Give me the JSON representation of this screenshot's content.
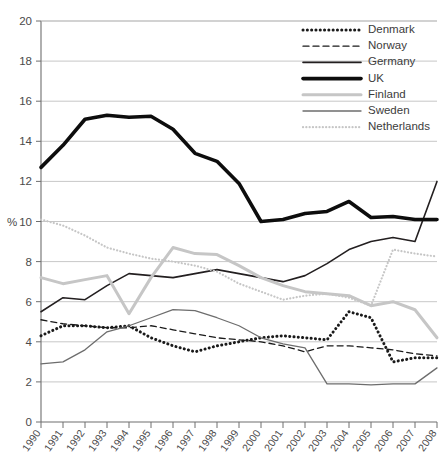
{
  "figure": {
    "truncated_header_text": "",
    "background": "#ffffff"
  },
  "chart_data": {
    "type": "line",
    "title": "",
    "xlabel": "",
    "ylabel": "%",
    "ylim": [
      0,
      20
    ],
    "ytick_step": 2,
    "yticks": [
      "0",
      "2",
      "4",
      "6",
      "8",
      "10",
      "12",
      "14",
      "16",
      "18",
      "20"
    ],
    "grid": true,
    "grid_axis": "y",
    "legend_position": "top-right",
    "x": [
      1990,
      1991,
      1992,
      1993,
      1994,
      1995,
      1996,
      1997,
      1998,
      1999,
      2000,
      2001,
      2002,
      2003,
      2004,
      2005,
      2006,
      2007,
      2008
    ],
    "categories": [
      "1990",
      "1991",
      "1992",
      "1993",
      "1994",
      "1995",
      "1996",
      "1997",
      "1998",
      "1999",
      "2000",
      "2001",
      "2002",
      "2003",
      "2004",
      "2005",
      "2006",
      "2007",
      "2008"
    ],
    "series": [
      {
        "name": "Denmark",
        "style": "dotted-thick",
        "color": "#1a1a1a",
        "width": 3.0,
        "dash": "0.1,4.2",
        "values": [
          4.3,
          4.8,
          4.8,
          4.7,
          4.8,
          4.2,
          3.8,
          3.5,
          3.8,
          4.0,
          4.2,
          4.3,
          4.2,
          4.1,
          5.5,
          5.2,
          3.0,
          3.2,
          3.2
        ]
      },
      {
        "name": "Norway",
        "style": "dashed",
        "color": "#1a1a1a",
        "width": 1.3,
        "dash": "6,4",
        "values": [
          5.1,
          4.9,
          4.8,
          4.7,
          4.7,
          4.8,
          4.6,
          4.4,
          4.2,
          4.1,
          4.0,
          3.8,
          3.5,
          3.8,
          3.8,
          3.7,
          3.6,
          3.4,
          3.3
        ]
      },
      {
        "name": "Germany",
        "style": "solid-thin",
        "color": "#231f20",
        "width": 1.6,
        "dash": "",
        "values": [
          5.5,
          6.2,
          6.1,
          6.8,
          7.4,
          7.3,
          7.2,
          7.4,
          7.6,
          7.4,
          7.2,
          7.0,
          7.3,
          7.9,
          8.6,
          9.0,
          9.2,
          9.0,
          12.0
        ]
      },
      {
        "name": "UK",
        "style": "solid-thick",
        "color": "#0d0d0d",
        "width": 3.6,
        "dash": "",
        "values": [
          12.7,
          13.8,
          15.1,
          15.3,
          15.2,
          15.25,
          14.6,
          13.4,
          13.0,
          11.9,
          10.0,
          10.1,
          10.4,
          10.5,
          11.0,
          10.2,
          10.25,
          10.1,
          10.1
        ]
      },
      {
        "name": "Finland",
        "style": "solid-thick-light",
        "color": "#c6c6c6",
        "width": 3.0,
        "dash": "",
        "values": [
          7.2,
          6.9,
          7.1,
          7.3,
          5.4,
          7.2,
          8.7,
          8.4,
          8.35,
          7.8,
          7.2,
          6.8,
          6.5,
          6.4,
          6.3,
          5.8,
          6.0,
          5.6,
          4.2
        ]
      },
      {
        "name": "Sweden",
        "style": "solid-medium",
        "color": "#6d6d6d",
        "width": 1.3,
        "dash": "",
        "values": [
          2.9,
          3.0,
          3.6,
          4.5,
          4.8,
          5.2,
          5.6,
          5.55,
          5.2,
          4.8,
          4.2,
          3.9,
          3.7,
          1.9,
          1.9,
          1.85,
          1.9,
          1.9,
          2.7
        ]
      },
      {
        "name": "Netherlands",
        "style": "dotted-light",
        "color": "#c6c6c6",
        "width": 2.2,
        "dash": "0.1,3.2",
        "values": [
          10.1,
          9.8,
          9.3,
          8.7,
          8.4,
          8.15,
          8.0,
          7.8,
          7.5,
          6.9,
          6.5,
          6.1,
          6.3,
          6.4,
          6.2,
          5.8,
          8.6,
          8.4,
          8.25
        ]
      }
    ],
    "legend": [
      {
        "label": "Denmark"
      },
      {
        "label": "Norway"
      },
      {
        "label": "Germany"
      },
      {
        "label": "UK"
      },
      {
        "label": "Finland"
      },
      {
        "label": "Sweden"
      },
      {
        "label": "Netherlands"
      }
    ]
  }
}
